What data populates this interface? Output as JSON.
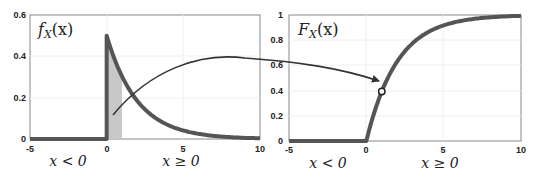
{
  "colors": {
    "curve": "#555555",
    "shade": "#c8c8c8",
    "arrow": "#333333",
    "axes": "#888888",
    "grid": "#eeeeee",
    "background": "#ffffff"
  },
  "left_panel": {
    "title": "fX(x)",
    "title_main": "f",
    "title_sub": "X",
    "title_arg": "(x)",
    "region_left_label": "x < 0",
    "region_right_label": "x ≥ 0",
    "xticks": [
      "-5",
      "0",
      "5",
      "10"
    ],
    "yticks": [
      "0",
      "0.2",
      "0.4",
      "0.6"
    ]
  },
  "right_panel": {
    "title": "FX(x)",
    "title_main": "F",
    "title_sub": "X",
    "title_arg": "(x)",
    "region_left_label": "x < 0",
    "region_right_label": "x ≥ 0",
    "xticks": [
      "-5",
      "0",
      "5",
      "10"
    ],
    "yticks": [
      "0",
      "0.2",
      "0.4",
      "0.6",
      "0.8",
      "1"
    ]
  },
  "chart_data": [
    {
      "type": "line",
      "title": "fX(x)",
      "description": "Exponential PDF with rate 0.5; area from x=0 to x=1 shaded",
      "xlabel": "",
      "ylabel": "",
      "xlim": [
        -5,
        10
      ],
      "ylim": [
        0,
        0.6
      ],
      "xticks": [
        -5,
        0,
        5,
        10
      ],
      "yticks": [
        0,
        0.2,
        0.4,
        0.6
      ],
      "grid": true,
      "series": [
        {
          "name": "pdf",
          "x": [
            -5,
            0,
            0,
            1,
            2,
            3,
            4,
            5,
            6,
            7,
            8,
            9,
            10
          ],
          "y": [
            0,
            0,
            0.5,
            0.303,
            0.184,
            0.112,
            0.068,
            0.041,
            0.025,
            0.015,
            0.009,
            0.006,
            0.003
          ]
        }
      ],
      "shaded_region": {
        "x_from": 0,
        "x_to": 1
      },
      "annotations": [
        "x < 0",
        "x ≥ 0"
      ]
    },
    {
      "type": "line",
      "title": "FX(x)",
      "description": "Exponential CDF with rate 0.5; marker at x=1",
      "xlabel": "",
      "ylabel": "",
      "xlim": [
        -5,
        10
      ],
      "ylim": [
        0,
        1
      ],
      "xticks": [
        -5,
        0,
        5,
        10
      ],
      "yticks": [
        0,
        0.2,
        0.4,
        0.6,
        0.8,
        1
      ],
      "grid": true,
      "series": [
        {
          "name": "cdf",
          "x": [
            -5,
            0,
            1,
            2,
            3,
            4,
            5,
            6,
            7,
            8,
            9,
            10
          ],
          "y": [
            0,
            0,
            0.393,
            0.632,
            0.777,
            0.865,
            0.918,
            0.95,
            0.97,
            0.982,
            0.989,
            0.993
          ]
        }
      ],
      "marker": {
        "x": 1,
        "y": 0.393
      },
      "annotations": [
        "x < 0",
        "x ≥ 0",
        "arrow from shaded pdf area to CDF marker"
      ]
    }
  ]
}
